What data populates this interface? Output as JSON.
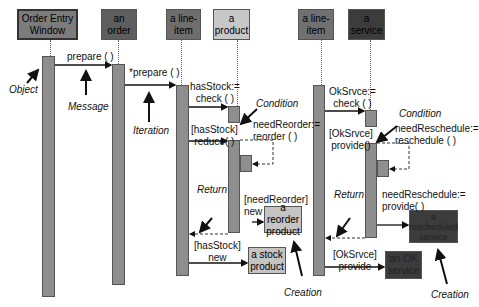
{
  "objects": {
    "order_entry_window": "Order Entry\nWindow",
    "an_order": "an order",
    "a_line_item_1": "a line-\nitem",
    "a_product": "a product",
    "a_line_item_2": "a line-\nitem",
    "a_service": "a service"
  },
  "messages": {
    "prepare": "prepare ( )",
    "prepare_iter": "*prepare ( )",
    "has_stock_check": "hasStock:=\ncheck ( )",
    "has_stock_reduce": "[hasStock]\nreduce( )",
    "need_reorder": "needReorder:=\nreorder ( )",
    "need_reorder_new": "[needReorder]\nnew",
    "has_stock_new": "[hasStock]\nnew",
    "ok_srvce_check": "OkSrvce:=\ncheck ( )",
    "ok_srvce_provide": "[OkSrvce]\nprovide()",
    "need_reschedule": "needReschedule:=\nreschedule ( )",
    "need_reschedule_provide": "needReschedule:=\nprovide( )",
    "ok_srvce_provide_2": "[OkSrvce]\nprovide"
  },
  "created": {
    "reorder_product": "a reorder\nproduct",
    "stock_product": "a stock\nproduct",
    "rescheduled_service": "a\nrescheduled\nservice",
    "ok_service": "an OK\nservice"
  },
  "annotations": {
    "object": "Object",
    "message": "Message",
    "iteration": "Iteration",
    "condition_1": "Condition",
    "condition_2": "Condition",
    "return_1": "Return",
    "return_2": "Return",
    "creation_1": "Creation",
    "creation_2": "Creation"
  },
  "colors": {
    "dark_object": "#5a5a5a",
    "mid_object": "#7a7a7a",
    "light_object": "#c8c8c8",
    "darkest_object": "#3c3c3c",
    "activation": "#8e8e8e"
  }
}
